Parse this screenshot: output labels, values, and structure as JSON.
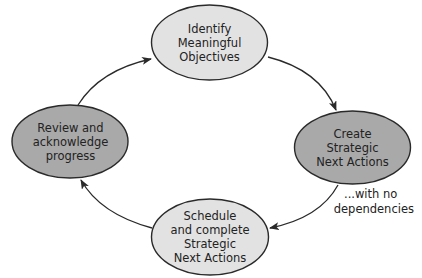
{
  "diagram": {
    "type": "cycle",
    "colors": {
      "light_fill": "#e2e2e2",
      "dark_fill": "#a9a9a9",
      "stroke": "#2a2a2a",
      "text": "#222222"
    },
    "nodes": [
      {
        "id": "identify",
        "lines": [
          "Identify",
          "Meaningful",
          "Objectives"
        ],
        "fill": "light",
        "position": "top"
      },
      {
        "id": "create",
        "lines": [
          "Create",
          "Strategic",
          "Next Actions"
        ],
        "fill": "dark",
        "position": "right"
      },
      {
        "id": "schedule",
        "lines": [
          "Schedule",
          "and complete",
          "Strategic",
          "Next Actions"
        ],
        "fill": "light",
        "position": "bottom"
      },
      {
        "id": "review",
        "lines": [
          "Review and",
          "acknowledge",
          "progress"
        ],
        "fill": "dark",
        "position": "left"
      }
    ],
    "edges": [
      {
        "from": "review",
        "to": "identify"
      },
      {
        "from": "identify",
        "to": "create"
      },
      {
        "from": "create",
        "to": "schedule"
      },
      {
        "from": "schedule",
        "to": "review"
      }
    ],
    "annotation": {
      "lines": [
        "...with no",
        "dependencies"
      ],
      "attached_to": "create"
    }
  }
}
